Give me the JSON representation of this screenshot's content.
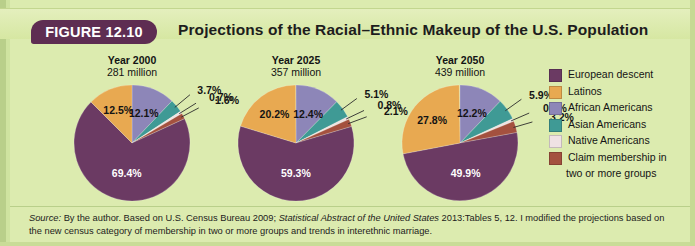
{
  "figure": {
    "badge": "FIGURE 12.10",
    "title": "Projections of the Racial–Ethnic Makeup of the U.S. Population"
  },
  "legend": {
    "items": [
      {
        "label": "European descent",
        "color": "#6b3a63"
      },
      {
        "label": "Latinos",
        "color": "#e8a951"
      },
      {
        "label": "African Americans",
        "color": "#8d86b8"
      },
      {
        "label": "Asian Americans",
        "color": "#3f9a95"
      },
      {
        "label": "Native Americans",
        "color": "#efe2e4"
      },
      {
        "label": "Claim membership in",
        "color": "#a4513f"
      }
    ],
    "continuation": "two or more groups"
  },
  "source": {
    "prefix": "Source:",
    "line": " By the author. Based on U.S. Census Bureau 2009; ",
    "italic1": "Statistical Abstract of the United States",
    "line2": " 2013:Tables 5, 12. I modified the projections based on the new census category of membership in two or more groups and trends in interethnic marriage."
  },
  "chart_data": [
    {
      "type": "pie",
      "title": "Year 2000",
      "subtitle": "281 million",
      "categories": [
        "European descent",
        "Latinos",
        "African Americans",
        "Asian Americans",
        "Native Americans",
        "Claim membership in two or more groups"
      ],
      "values": [
        69.4,
        12.5,
        12.1,
        3.7,
        0.7,
        1.6
      ],
      "colors": [
        "#6b3a63",
        "#e8a951",
        "#8d86b8",
        "#3f9a95",
        "#efe2e4",
        "#a4513f"
      ],
      "labels": [
        "69.4%",
        "12.5%",
        "12.1%",
        "3.7%",
        "0.7%",
        "1.6%"
      ]
    },
    {
      "type": "pie",
      "title": "Year 2025",
      "subtitle": "357 million",
      "categories": [
        "European descent",
        "Latinos",
        "African Americans",
        "Asian Americans",
        "Native Americans",
        "Claim membership in two or more groups"
      ],
      "values": [
        59.3,
        20.2,
        12.4,
        5.1,
        0.8,
        2.1
      ],
      "colors": [
        "#6b3a63",
        "#e8a951",
        "#8d86b8",
        "#3f9a95",
        "#efe2e4",
        "#a4513f"
      ],
      "labels": [
        "59.3%",
        "20.2%",
        "12.4%",
        "5.1%",
        "0.8%",
        "2.1%"
      ]
    },
    {
      "type": "pie",
      "title": "Year 2050",
      "subtitle": "439 million",
      "categories": [
        "European descent",
        "Latinos",
        "African Americans",
        "Asian Americans",
        "Native Americans",
        "Claim membership in two or more groups"
      ],
      "values": [
        49.9,
        27.8,
        12.2,
        5.9,
        0.8,
        3.2
      ],
      "colors": [
        "#6b3a63",
        "#e8a951",
        "#8d86b8",
        "#3f9a95",
        "#efe2e4",
        "#a4513f"
      ],
      "labels": [
        "49.9%",
        "27.8%",
        "12.2%",
        "5.9%",
        "0.8%",
        "3.2%"
      ]
    }
  ]
}
